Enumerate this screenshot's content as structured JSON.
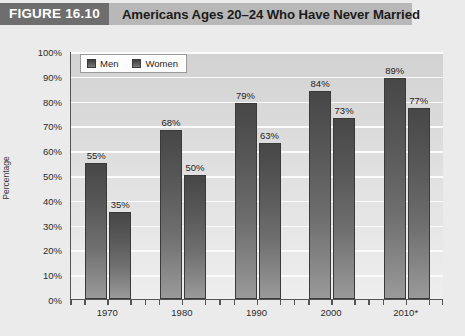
{
  "header": {
    "figure_label": "FIGURE 16.10",
    "title": "Americans Ages 20–24 Who Have Never Married",
    "label_bg": "#6e6e6e",
    "bar_bg": "#b8b8b8"
  },
  "chart_data": {
    "type": "bar",
    "title": "Americans Ages 20–24 Who Have Never Married",
    "xlabel": "",
    "ylabel": "Percentage",
    "ylim": [
      0,
      100
    ],
    "ytick_labels": [
      "100%",
      "90%",
      "80%",
      "70%",
      "60%",
      "50%",
      "40%",
      "30%",
      "20%",
      "10%",
      "0%"
    ],
    "ytick_values": [
      100,
      90,
      80,
      70,
      60,
      50,
      40,
      30,
      20,
      10,
      0
    ],
    "categories": [
      "1970",
      "1980",
      "1990",
      "2000",
      "2010*"
    ],
    "grid": true,
    "legend_position": "top-left",
    "series": [
      {
        "name": "Men",
        "values": [
          55,
          68,
          79,
          84,
          89
        ],
        "labels": [
          "55%",
          "68%",
          "79%",
          "84%",
          "89%"
        ]
      },
      {
        "name": "Women",
        "values": [
          35,
          50,
          63,
          73,
          77
        ],
        "labels": [
          "35%",
          "50%",
          "63%",
          "73%",
          "77%"
        ]
      }
    ],
    "bar_color_top": "#474747",
    "bar_color_bottom": "#9a9a9a",
    "plot_bg": "#dedede",
    "gridline_color": "#fbfbfb"
  }
}
